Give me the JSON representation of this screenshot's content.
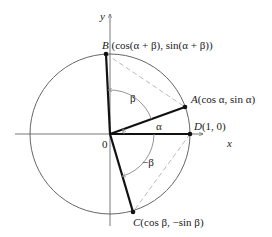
{
  "figure": {
    "type": "unit-circle-angle-addition",
    "center": [
      110,
      134
    ],
    "radius": 80,
    "colors": {
      "circle": "#666666",
      "axes": "#555555",
      "segments": "#111111",
      "dashed": "#bbbbbb",
      "arcs": "#888888",
      "text": "#222222"
    }
  },
  "axes": {
    "x_label": "x",
    "y_label": "y",
    "origin_label": "0"
  },
  "points": {
    "A": {
      "letter": "A",
      "coords": "(cos α, sin α)",
      "xy": [
        185,
        107
      ]
    },
    "B": {
      "letter": "B",
      "coords": "(cos(α + β), sin(α + β))",
      "xy": [
        106,
        54
      ]
    },
    "C": {
      "letter": "C",
      "coords": "(cos β, −sin β)",
      "xy": [
        133,
        212
      ]
    },
    "D": {
      "letter": "D",
      "coords": "(1, 0)",
      "xy": [
        190,
        134
      ]
    }
  },
  "angles": {
    "alpha": "α",
    "beta": "β",
    "neg_beta": "−β"
  }
}
